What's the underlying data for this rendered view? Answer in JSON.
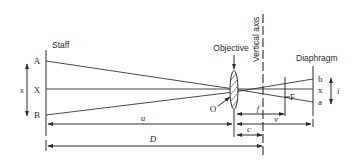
{
  "diagram": {
    "labels": {
      "staff": "Staff",
      "objective": "Objective",
      "vertical_axis": "Vertical axis",
      "diaphragm": "Diaphragm",
      "point_A": "A",
      "point_X": "X",
      "point_B": "B",
      "point_O": "O",
      "point_F": "F",
      "point_b": "b",
      "point_x": "x",
      "point_a": "a"
    },
    "dimensions": {
      "staff_intercept": "s",
      "image_intercept": "i",
      "object_distance": "u",
      "image_distance": "v",
      "focal_length": "f",
      "instrument_constant": "c",
      "total_distance": "D"
    },
    "colors": {
      "line": "#2a2a2a",
      "background": "#ffffff"
    }
  }
}
